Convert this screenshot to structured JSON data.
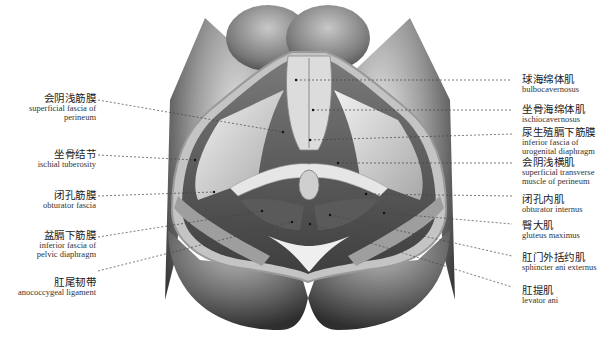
{
  "figure": {
    "colors": {
      "background": "#ffffff",
      "skin_dark": "#3a3a3a",
      "skin_mid": "#8a8a8a",
      "muscle_light": "#d8d8d8",
      "fat_border": "#bdbdbd",
      "leader_line": "#444444"
    }
  },
  "labels": {
    "left": [
      {
        "zh": "会阴浅筋膜",
        "en": "superficial fascia of\nperineum"
      },
      {
        "zh": "坐骨结节",
        "en": "ischial tuberosity"
      },
      {
        "zh": "闭孔筋膜",
        "en": "obturator fascia"
      },
      {
        "zh": "盆膈下筋膜",
        "en": "inferior fascia of\npelvic diaphragm"
      },
      {
        "zh": "肛尾韧带",
        "en": "anococcygeal ligament"
      }
    ],
    "right": [
      {
        "zh": "球海绵体肌",
        "en": "bulbocavernosus"
      },
      {
        "zh": "坐骨海绵体肌",
        "en": "ischiocavernosus"
      },
      {
        "zh": "尿生殖膈下筋膜",
        "en": "inferior fascia of\nurogenital diaphragm"
      },
      {
        "zh": "会阴浅横肌",
        "en": "superficial transverse\nmuscle of perineum"
      },
      {
        "zh": "闭孔内肌",
        "en": "obturator internus"
      },
      {
        "zh": "臀大肌",
        "en": "gluteus maximus"
      },
      {
        "zh": "肛门外括约肌",
        "en": "sphincter ani externus"
      },
      {
        "zh": "肛提肌",
        "en": "levator ani"
      }
    ]
  }
}
